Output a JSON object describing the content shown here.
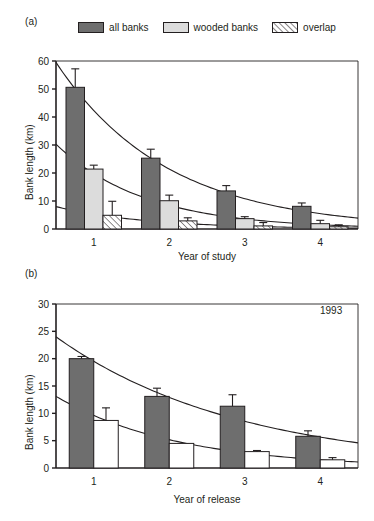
{
  "figure": {
    "panel_a_label": "(a)",
    "panel_b_label": "(b)"
  },
  "legend": {
    "items": [
      {
        "key": "all_banks",
        "label": "all banks",
        "fill": "#6e6e6e",
        "style": "solid",
        "icon": "legend-swatch-dark"
      },
      {
        "key": "wooded_banks",
        "label": "wooded banks",
        "fill": "#dcdcdc",
        "style": "solid",
        "icon": "legend-swatch-light"
      },
      {
        "key": "overlap",
        "label": "overlap",
        "fill": "#ffffff",
        "style": "hatched",
        "icon": "legend-swatch-hatched"
      }
    ]
  },
  "chart_data": [
    {
      "panel": "(a)",
      "type": "bar",
      "title": "",
      "xlabel": "Year of study",
      "ylabel": "Bank length (km)",
      "categories": [
        "1",
        "2",
        "3",
        "4"
      ],
      "xticklabels": [
        "1",
        "2",
        "3",
        "4"
      ],
      "yticks": [
        0,
        10,
        20,
        30,
        40,
        50,
        60
      ],
      "yticklabels": [
        "0",
        "10",
        "20",
        "30",
        "40",
        "50",
        "60"
      ],
      "ylim": [
        0,
        60
      ],
      "grid": false,
      "legend_position": "above-plot",
      "errorbars": true,
      "series": [
        {
          "name": "all banks",
          "fill": "#6e6e6e",
          "style": "solid",
          "values": [
            50.6,
            25.3,
            13.6,
            8.1
          ],
          "err_upper": [
            6.6,
            3.2,
            1.9,
            1.2
          ],
          "err_lower": [
            0,
            0,
            0,
            0
          ]
        },
        {
          "name": "wooded banks",
          "fill": "#dcdcdc",
          "style": "solid",
          "values": [
            21.4,
            10.1,
            3.7,
            1.9
          ],
          "err_upper": [
            1.4,
            2.0,
            0.7,
            1.2
          ],
          "err_lower": [
            0,
            0,
            0,
            0
          ]
        },
        {
          "name": "overlap",
          "fill": "#ffffff",
          "style": "hatched",
          "values": [
            4.9,
            2.9,
            1.1,
            0.8
          ],
          "err_upper": [
            5.0,
            1.1,
            1.2,
            0.7
          ],
          "err_lower": [
            0,
            0,
            0,
            0
          ]
        }
      ],
      "fitted_curves": [
        {
          "name": "all banks fit",
          "y_start": 59.5,
          "y_end": 3.9,
          "decay": "exponential"
        },
        {
          "name": "wooded banks fit",
          "y_start": 30.3,
          "y_end": 1.0,
          "decay": "exponential"
        },
        {
          "name": "overlap fit",
          "y_start": 8.0,
          "y_end": 0.3,
          "decay": "exponential"
        }
      ]
    },
    {
      "panel": "(b)",
      "type": "bar",
      "title": "",
      "xlabel": "Year of release",
      "ylabel": "Bank length (km)",
      "annotation": "1993",
      "categories": [
        "1",
        "2",
        "3",
        "4"
      ],
      "xticklabels": [
        "1",
        "2",
        "3",
        "4"
      ],
      "yticks": [
        0,
        5,
        10,
        15,
        20,
        25,
        30
      ],
      "yticklabels": [
        "0",
        "5",
        "10",
        "15",
        "20",
        "25",
        "30"
      ],
      "ylim": [
        0,
        30
      ],
      "grid": false,
      "legend_position": "none",
      "errorbars": true,
      "series": [
        {
          "name": "all banks",
          "fill": "#6e6e6e",
          "style": "solid",
          "values": [
            20.0,
            13.1,
            11.3,
            5.8
          ],
          "err_upper": [
            0.4,
            1.5,
            2.1,
            1.0
          ],
          "err_lower": [
            0,
            0,
            0,
            0
          ]
        },
        {
          "name": "wooded banks",
          "fill": "#ffffff",
          "style": "solid",
          "values": [
            8.7,
            4.5,
            3.0,
            1.5
          ],
          "err_upper": [
            2.3,
            0.0,
            0.2,
            0.4
          ],
          "err_lower": [
            0,
            0,
            0,
            0
          ]
        }
      ],
      "fitted_curves": [
        {
          "name": "all banks fit",
          "y_start": 24.0,
          "y_end": 4.6,
          "decay": "exponential"
        },
        {
          "name": "wooded banks fit",
          "y_start": 13.1,
          "y_end": 1.1,
          "decay": "exponential"
        }
      ]
    }
  ]
}
